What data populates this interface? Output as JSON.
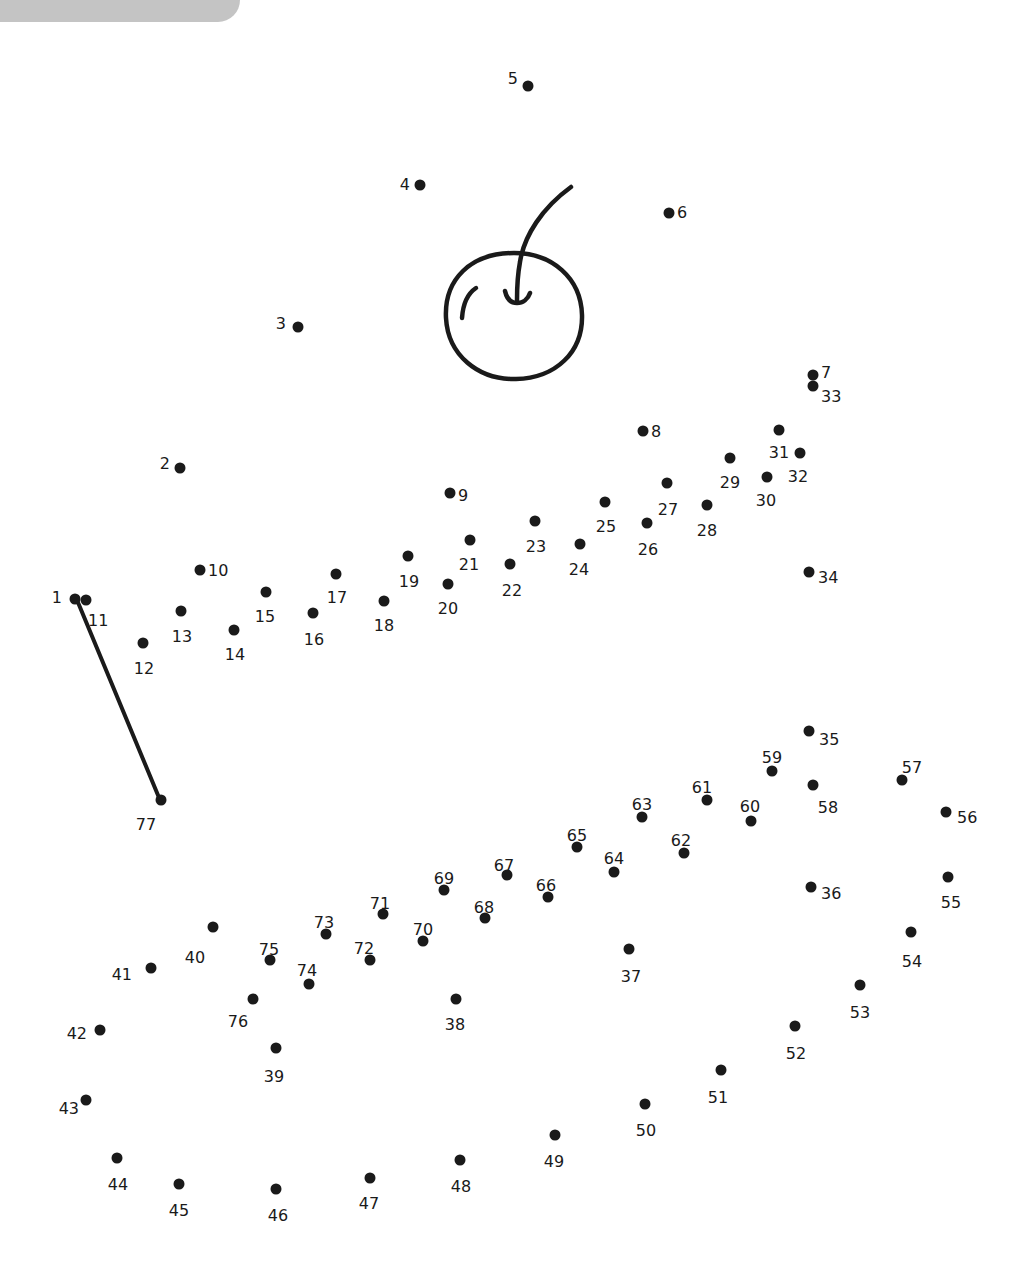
{
  "colors": {
    "ink": "#1a1a1a",
    "corner_tab": "#c4c4c4",
    "background": "#ffffff"
  },
  "drawn_line": {
    "from": 1,
    "to": 77
  },
  "picture_hint": "cherry",
  "dots": [
    {
      "n": 1,
      "x": 75,
      "y": 599,
      "lx": 62,
      "ly": 597,
      "a": "end"
    },
    {
      "n": 2,
      "x": 180,
      "y": 468,
      "lx": 170,
      "ly": 463,
      "a": "end"
    },
    {
      "n": 3,
      "x": 298,
      "y": 327,
      "lx": 286,
      "ly": 323,
      "a": "end"
    },
    {
      "n": 4,
      "x": 420,
      "y": 185,
      "lx": 410,
      "ly": 184,
      "a": "end"
    },
    {
      "n": 5,
      "x": 528,
      "y": 86,
      "lx": 518,
      "ly": 78,
      "a": "end"
    },
    {
      "n": 6,
      "x": 669,
      "y": 213,
      "lx": 677,
      "ly": 212,
      "a": "start"
    },
    {
      "n": 7,
      "x": 813,
      "y": 375,
      "lx": 821,
      "ly": 372,
      "a": "start"
    },
    {
      "n": 8,
      "x": 643,
      "y": 431,
      "lx": 651,
      "ly": 431,
      "a": "start"
    },
    {
      "n": 9,
      "x": 450,
      "y": 493,
      "lx": 458,
      "ly": 495,
      "a": "start"
    },
    {
      "n": 10,
      "x": 200,
      "y": 570,
      "lx": 208,
      "ly": 570,
      "a": "start"
    },
    {
      "n": 11,
      "x": 86,
      "y": 600,
      "lx": 88,
      "ly": 620,
      "a": "start"
    },
    {
      "n": 12,
      "x": 143,
      "y": 643,
      "lx": 144,
      "ly": 668,
      "a": "middle"
    },
    {
      "n": 13,
      "x": 181,
      "y": 611,
      "lx": 182,
      "ly": 636,
      "a": "middle"
    },
    {
      "n": 14,
      "x": 234,
      "y": 630,
      "lx": 235,
      "ly": 654,
      "a": "middle"
    },
    {
      "n": 15,
      "x": 266,
      "y": 592,
      "lx": 265,
      "ly": 616,
      "a": "middle"
    },
    {
      "n": 16,
      "x": 313,
      "y": 613,
      "lx": 314,
      "ly": 639,
      "a": "middle"
    },
    {
      "n": 17,
      "x": 336,
      "y": 574,
      "lx": 337,
      "ly": 597,
      "a": "middle"
    },
    {
      "n": 18,
      "x": 384,
      "y": 601,
      "lx": 384,
      "ly": 625,
      "a": "middle"
    },
    {
      "n": 19,
      "x": 408,
      "y": 556,
      "lx": 409,
      "ly": 581,
      "a": "middle"
    },
    {
      "n": 20,
      "x": 448,
      "y": 584,
      "lx": 448,
      "ly": 608,
      "a": "middle"
    },
    {
      "n": 21,
      "x": 470,
      "y": 540,
      "lx": 469,
      "ly": 564,
      "a": "middle"
    },
    {
      "n": 22,
      "x": 510,
      "y": 564,
      "lx": 512,
      "ly": 590,
      "a": "middle"
    },
    {
      "n": 23,
      "x": 535,
      "y": 521,
      "lx": 536,
      "ly": 546,
      "a": "middle"
    },
    {
      "n": 24,
      "x": 580,
      "y": 544,
      "lx": 579,
      "ly": 569,
      "a": "middle"
    },
    {
      "n": 25,
      "x": 605,
      "y": 502,
      "lx": 606,
      "ly": 526,
      "a": "middle"
    },
    {
      "n": 26,
      "x": 647,
      "y": 523,
      "lx": 648,
      "ly": 549,
      "a": "middle"
    },
    {
      "n": 27,
      "x": 667,
      "y": 483,
      "lx": 668,
      "ly": 509,
      "a": "middle"
    },
    {
      "n": 28,
      "x": 707,
      "y": 505,
      "lx": 707,
      "ly": 530,
      "a": "middle"
    },
    {
      "n": 29,
      "x": 730,
      "y": 458,
      "lx": 730,
      "ly": 482,
      "a": "middle"
    },
    {
      "n": 30,
      "x": 767,
      "y": 477,
      "lx": 766,
      "ly": 500,
      "a": "middle"
    },
    {
      "n": 31,
      "x": 779,
      "y": 430,
      "lx": 779,
      "ly": 452,
      "a": "middle"
    },
    {
      "n": 32,
      "x": 800,
      "y": 453,
      "lx": 798,
      "ly": 476,
      "a": "middle"
    },
    {
      "n": 33,
      "x": 813,
      "y": 386,
      "lx": 821,
      "ly": 396,
      "a": "start"
    },
    {
      "n": 34,
      "x": 809,
      "y": 572,
      "lx": 818,
      "ly": 577,
      "a": "start"
    },
    {
      "n": 35,
      "x": 809,
      "y": 731,
      "lx": 819,
      "ly": 739,
      "a": "start"
    },
    {
      "n": 36,
      "x": 811,
      "y": 887,
      "lx": 821,
      "ly": 893,
      "a": "start"
    },
    {
      "n": 37,
      "x": 629,
      "y": 949,
      "lx": 631,
      "ly": 976,
      "a": "middle"
    },
    {
      "n": 38,
      "x": 456,
      "y": 999,
      "lx": 455,
      "ly": 1024,
      "a": "middle"
    },
    {
      "n": 39,
      "x": 276,
      "y": 1048,
      "lx": 274,
      "ly": 1076,
      "a": "middle"
    },
    {
      "n": 40,
      "x": 213,
      "y": 927,
      "lx": 195,
      "ly": 957,
      "a": "middle"
    },
    {
      "n": 41,
      "x": 151,
      "y": 968,
      "lx": 132,
      "ly": 974,
      "a": "end"
    },
    {
      "n": 42,
      "x": 100,
      "y": 1030,
      "lx": 87,
      "ly": 1033,
      "a": "end"
    },
    {
      "n": 43,
      "x": 86,
      "y": 1100,
      "lx": 79,
      "ly": 1108,
      "a": "end"
    },
    {
      "n": 44,
      "x": 117,
      "y": 1158,
      "lx": 118,
      "ly": 1184,
      "a": "middle"
    },
    {
      "n": 45,
      "x": 179,
      "y": 1184,
      "lx": 179,
      "ly": 1210,
      "a": "middle"
    },
    {
      "n": 46,
      "x": 276,
      "y": 1189,
      "lx": 278,
      "ly": 1215,
      "a": "middle"
    },
    {
      "n": 47,
      "x": 370,
      "y": 1178,
      "lx": 369,
      "ly": 1203,
      "a": "middle"
    },
    {
      "n": 48,
      "x": 460,
      "y": 1160,
      "lx": 461,
      "ly": 1186,
      "a": "middle"
    },
    {
      "n": 49,
      "x": 555,
      "y": 1135,
      "lx": 554,
      "ly": 1161,
      "a": "middle"
    },
    {
      "n": 50,
      "x": 645,
      "y": 1104,
      "lx": 646,
      "ly": 1130,
      "a": "middle"
    },
    {
      "n": 51,
      "x": 721,
      "y": 1070,
      "lx": 718,
      "ly": 1097,
      "a": "middle"
    },
    {
      "n": 52,
      "x": 795,
      "y": 1026,
      "lx": 796,
      "ly": 1053,
      "a": "middle"
    },
    {
      "n": 53,
      "x": 860,
      "y": 985,
      "lx": 860,
      "ly": 1012,
      "a": "middle"
    },
    {
      "n": 54,
      "x": 911,
      "y": 932,
      "lx": 912,
      "ly": 961,
      "a": "middle"
    },
    {
      "n": 55,
      "x": 948,
      "y": 877,
      "lx": 951,
      "ly": 902,
      "a": "middle"
    },
    {
      "n": 56,
      "x": 946,
      "y": 812,
      "lx": 957,
      "ly": 817,
      "a": "start"
    },
    {
      "n": 57,
      "x": 902,
      "y": 780,
      "lx": 912,
      "ly": 767,
      "a": "middle"
    },
    {
      "n": 58,
      "x": 813,
      "y": 785,
      "lx": 828,
      "ly": 807,
      "a": "middle"
    },
    {
      "n": 59,
      "x": 772,
      "y": 771,
      "lx": 772,
      "ly": 757,
      "a": "middle"
    },
    {
      "n": 60,
      "x": 751,
      "y": 821,
      "lx": 750,
      "ly": 806,
      "a": "middle"
    },
    {
      "n": 61,
      "x": 707,
      "y": 800,
      "lx": 702,
      "ly": 787,
      "a": "middle"
    },
    {
      "n": 62,
      "x": 684,
      "y": 853,
      "lx": 681,
      "ly": 840,
      "a": "middle"
    },
    {
      "n": 63,
      "x": 642,
      "y": 817,
      "lx": 642,
      "ly": 804,
      "a": "middle"
    },
    {
      "n": 64,
      "x": 614,
      "y": 872,
      "lx": 614,
      "ly": 858,
      "a": "middle"
    },
    {
      "n": 65,
      "x": 577,
      "y": 847,
      "lx": 577,
      "ly": 835,
      "a": "middle"
    },
    {
      "n": 66,
      "x": 548,
      "y": 897,
      "lx": 546,
      "ly": 885,
      "a": "middle"
    },
    {
      "n": 67,
      "x": 507,
      "y": 875,
      "lx": 504,
      "ly": 865,
      "a": "middle"
    },
    {
      "n": 68,
      "x": 485,
      "y": 918,
      "lx": 484,
      "ly": 907,
      "a": "middle"
    },
    {
      "n": 69,
      "x": 444,
      "y": 890,
      "lx": 444,
      "ly": 878,
      "a": "middle"
    },
    {
      "n": 70,
      "x": 423,
      "y": 941,
      "lx": 423,
      "ly": 929,
      "a": "middle"
    },
    {
      "n": 71,
      "x": 383,
      "y": 914,
      "lx": 380,
      "ly": 903,
      "a": "middle"
    },
    {
      "n": 72,
      "x": 370,
      "y": 960,
      "lx": 364,
      "ly": 948,
      "a": "middle"
    },
    {
      "n": 73,
      "x": 326,
      "y": 934,
      "lx": 324,
      "ly": 922,
      "a": "middle"
    },
    {
      "n": 74,
      "x": 309,
      "y": 984,
      "lx": 307,
      "ly": 970,
      "a": "middle"
    },
    {
      "n": 75,
      "x": 270,
      "y": 960,
      "lx": 269,
      "ly": 949,
      "a": "middle"
    },
    {
      "n": 76,
      "x": 253,
      "y": 999,
      "lx": 238,
      "ly": 1021,
      "a": "middle"
    },
    {
      "n": 77,
      "x": 161,
      "y": 800,
      "lx": 146,
      "ly": 824,
      "a": "middle"
    }
  ]
}
